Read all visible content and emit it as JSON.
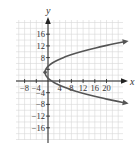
{
  "chart_data": {
    "type": "line",
    "title": "",
    "xlabel": "x",
    "ylabel": "y",
    "xlim": [
      -10,
      24
    ],
    "ylim": [
      -20,
      20
    ],
    "grid": true,
    "grid_spacing": 2,
    "x_ticks": [
      -8,
      -4,
      4,
      8,
      12,
      16,
      20
    ],
    "y_ticks": [
      16,
      12,
      8,
      4,
      -4,
      -8,
      -12,
      -16
    ],
    "x_tick_labels": [
      "−8",
      "−4",
      "4",
      "8",
      "12",
      "16",
      "20"
    ],
    "y_tick_labels": [
      "16",
      "12",
      "8",
      "−4",
      "−8",
      "−12",
      "−16"
    ],
    "series": [
      {
        "name": "parabola (y−3)² = 4(x+1)",
        "equation": "x = (y-3)^2/4 - 1",
        "vertex": [
          -1,
          3
        ],
        "y_range": [
          -7.5,
          13.5
        ],
        "arrows": "both ends",
        "color": "#555555"
      }
    ],
    "vertex_point": {
      "x": -1,
      "y": 3,
      "marked": true
    }
  },
  "colors": {
    "grid": "#d6d6d6",
    "axis": "#222222",
    "curve": "#555555"
  }
}
